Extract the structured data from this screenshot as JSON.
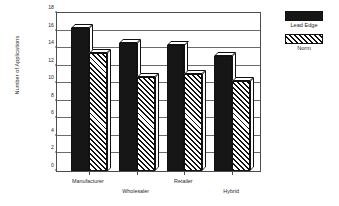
{
  "chart_data": {
    "type": "bar",
    "title": "",
    "xlabel": "",
    "ylabel": "Number of Applications",
    "categories": [
      "Manufacturer",
      "Wholesaler",
      "Retailer",
      "Hybrid"
    ],
    "series": [
      {
        "name": "Lead Edge",
        "values": [
          16.3,
          14.6,
          14.3,
          13.1
        ],
        "color": "#161616",
        "fill": "solid"
      },
      {
        "name": "Norm",
        "values": [
          13.5,
          10.7,
          11.1,
          10.3
        ],
        "color": "#111111",
        "fill": "diagonal-hatch"
      }
    ],
    "ylim": [
      0,
      18
    ],
    "y_ticks": [
      0,
      2,
      4,
      6,
      8,
      10,
      12,
      14,
      16,
      18
    ],
    "grid": true,
    "grid_axis": "y",
    "legend_position": "right",
    "bar_style": "3d-extruded",
    "label_stagger": true
  },
  "legend": {
    "entries": [
      {
        "label": "Lead Edge",
        "swatch": "solid-black-swatch"
      },
      {
        "label": "Norm",
        "swatch": "hatched-swatch"
      }
    ]
  }
}
